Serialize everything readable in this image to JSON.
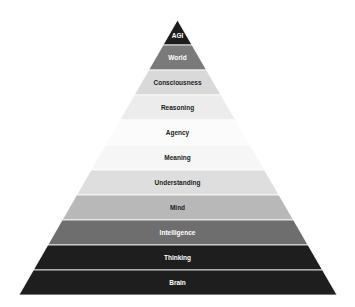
{
  "diagram": {
    "type": "pyramid",
    "apex": {
      "x": 177.5,
      "y": 20
    },
    "base": {
      "left": 19,
      "right": 337,
      "y": 295
    },
    "separator_color": "#ffffff",
    "layers": [
      {
        "label": "AGI",
        "fill": "#1c1c1c",
        "text_color": "#ffffff"
      },
      {
        "label": "World",
        "fill": "#7a7a7a",
        "text_color": "#ffffff"
      },
      {
        "label": "Consciousness",
        "fill": "#d9d9d9",
        "text_color": "#222222"
      },
      {
        "label": "Reasoning",
        "fill": "#ececec",
        "text_color": "#222222"
      },
      {
        "label": "Agency",
        "fill": "#fbfbfb",
        "text_color": "#222222"
      },
      {
        "label": "Meaning",
        "fill": "#f6f6f6",
        "text_color": "#222222"
      },
      {
        "label": "Understanding",
        "fill": "#dedede",
        "text_color": "#222222"
      },
      {
        "label": "Mind",
        "fill": "#b8b8b8",
        "text_color": "#222222"
      },
      {
        "label": "Intelligence",
        "fill": "#6e6e6e",
        "text_color": "#ffffff"
      },
      {
        "label": "Thinking",
        "fill": "#1e1e1e",
        "text_color": "#ffffff"
      },
      {
        "label": "Brain",
        "fill": "#1e1e1e",
        "text_color": "#ffffff"
      }
    ]
  }
}
